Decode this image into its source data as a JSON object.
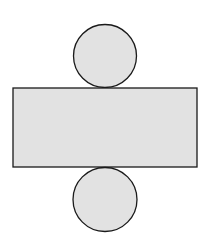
{
  "diagram": {
    "type": "cylinder-net",
    "colors": {
      "fill": "#e2e2e2",
      "stroke": "#1a1a1a",
      "background": "#ffffff"
    },
    "shapes": {
      "top_circle": {
        "cx": 105,
        "cy": 56,
        "r": 31.5
      },
      "rectangle": {
        "x": 13,
        "y": 88,
        "width": 184,
        "height": 79
      },
      "bottom_circle": {
        "cx": 105,
        "cy": 199.5,
        "r": 32
      }
    }
  }
}
